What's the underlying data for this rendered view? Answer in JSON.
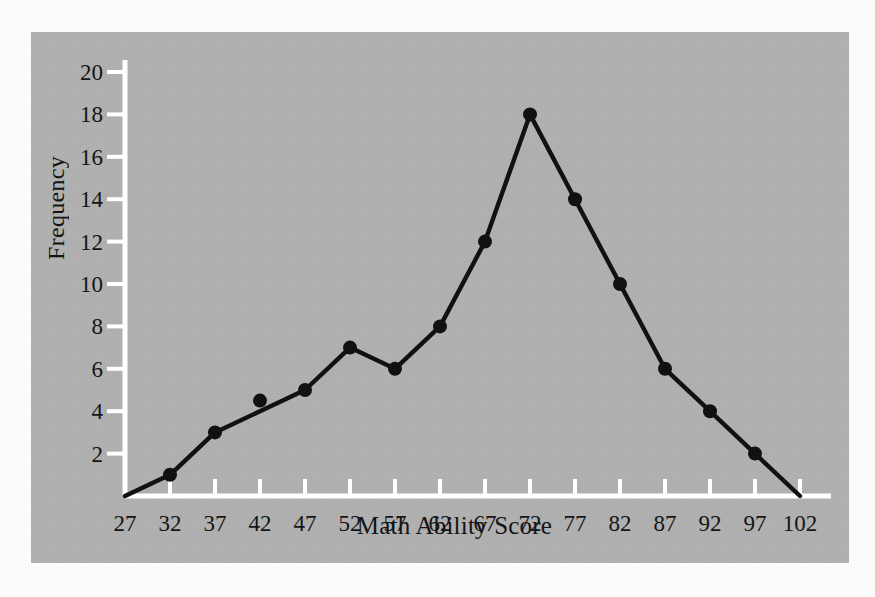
{
  "chart_data": {
    "type": "line",
    "title": "",
    "subtitle": "",
    "xlabel": "Math Ability Score",
    "ylabel": "Frequency",
    "x": [
      27,
      32,
      37,
      42,
      47,
      52,
      57,
      62,
      67,
      72,
      77,
      82,
      87,
      92,
      97,
      102
    ],
    "values": [
      0,
      1,
      3,
      4,
      5,
      7,
      6,
      8,
      12,
      18,
      14,
      10,
      6,
      4,
      2,
      0
    ],
    "marker_values": [
      null,
      1,
      3,
      4.5,
      5,
      7,
      6,
      8,
      12,
      18,
      14,
      10,
      6,
      4,
      2,
      null
    ],
    "xticklabels": [
      "27",
      "32",
      "37",
      "42",
      "47",
      "52",
      "57",
      "62",
      "67",
      "72",
      "77",
      "82",
      "87",
      "92",
      "97",
      "102"
    ],
    "yticks": [
      2,
      4,
      6,
      8,
      10,
      12,
      14,
      16,
      18,
      20
    ],
    "yticklabels": [
      "2",
      "4",
      "6",
      "8",
      "10",
      "12",
      "14",
      "16",
      "18",
      "20"
    ],
    "xlim": [
      27,
      102
    ],
    "ylim": [
      0,
      20
    ],
    "grid": false,
    "legend": null,
    "markers": "filled-circle"
  },
  "style": {
    "panel_background": "#acacac",
    "page_background": "#fbfbfb",
    "axis_color": "#ffffff",
    "line_color": "#111111",
    "marker_color": "#111111",
    "text_color": "#141414"
  }
}
